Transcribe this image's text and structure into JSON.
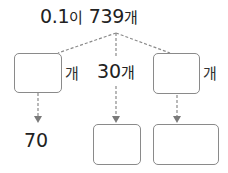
{
  "title": {
    "number": "0.1",
    "particle": "이",
    "count": "739",
    "unit": "개"
  },
  "branches": {
    "left": {
      "box_value": "",
      "unit": "개",
      "result": "70"
    },
    "middle": {
      "value": "30",
      "unit": "개",
      "result_box_value": ""
    },
    "right": {
      "box_value": "",
      "unit": "개",
      "result_box_value": ""
    }
  },
  "colors": {
    "line": "#8a8a8a",
    "box_border": "#8a8a8a",
    "text": "#222222"
  }
}
